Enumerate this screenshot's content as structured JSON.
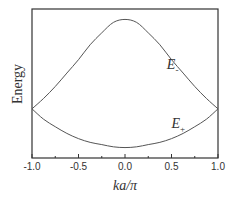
{
  "chart_data": {
    "type": "line",
    "title": "",
    "xlabel": "ka/π",
    "ylabel": "Energy",
    "xlim": [
      -1.0,
      1.0
    ],
    "ylim": [
      0,
      1
    ],
    "grid": false,
    "x_ticks": [
      "-1.0",
      "-0.5",
      "0.0",
      "0.5",
      "1.0"
    ],
    "x_tick_values": [
      -1.0,
      -0.5,
      0.0,
      0.5,
      1.0
    ],
    "x_minor_ticks": [
      -0.75,
      -0.25,
      0.25,
      0.75
    ],
    "y_ticks": [],
    "x": [
      -1.0,
      -0.875,
      -0.75,
      -0.625,
      -0.5,
      -0.375,
      -0.25,
      -0.125,
      0.0,
      0.125,
      0.25,
      0.375,
      0.5,
      0.625,
      0.75,
      0.875,
      1.0
    ],
    "series": [
      {
        "name": "E-",
        "label_main": "E",
        "label_sub": "-",
        "label_at": [
          0.45,
          0.6
        ],
        "values": [
          0.33,
          0.4,
          0.48,
          0.57,
          0.66,
          0.76,
          0.84,
          0.91,
          0.93,
          0.91,
          0.84,
          0.76,
          0.66,
          0.57,
          0.48,
          0.4,
          0.33
        ]
      },
      {
        "name": "E+",
        "label_main": "E",
        "label_sub": "+",
        "label_at": [
          0.5,
          0.2
        ],
        "values": [
          0.33,
          0.26,
          0.21,
          0.165,
          0.13,
          0.105,
          0.09,
          0.075,
          0.07,
          0.075,
          0.09,
          0.105,
          0.13,
          0.165,
          0.21,
          0.26,
          0.33
        ]
      }
    ]
  }
}
